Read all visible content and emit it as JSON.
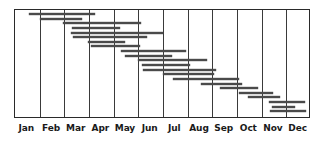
{
  "chart_data": {
    "type": "bar",
    "orientation": "horizontal",
    "subtype": "gantt",
    "title": "",
    "subtitle": "",
    "xlabel": "",
    "ylabel": "",
    "grid": true,
    "legend": null,
    "xlim": [
      0,
      12
    ],
    "x_axis_unit": "month",
    "categories": [
      "Jan",
      "Feb",
      "Mar",
      "Apr",
      "May",
      "Jun",
      "Jul",
      "Aug",
      "Sep",
      "Oct",
      "Nov",
      "Dec"
    ],
    "tick_labels": [
      "Jan",
      "Feb",
      "Mar",
      "Apr",
      "May",
      "Jun",
      "Jul",
      "Aug",
      "Sep",
      "Oct",
      "Nov",
      "Dec"
    ],
    "bar_color": "#4a4a4a",
    "frame_color": "#2a2a2a",
    "grid_color": "#3a3a3a",
    "background_color": "#ffffff",
    "task_count": 20,
    "tasks": [
      {
        "index": 1,
        "start_month": 0.55,
        "end_month": 3.25,
        "row": 1
      },
      {
        "index": 2,
        "start_month": 1.0,
        "end_month": 2.7,
        "row": 2
      },
      {
        "index": 3,
        "start_month": 1.95,
        "end_month": 5.1,
        "row": 3
      },
      {
        "index": 4,
        "start_month": 2.3,
        "end_month": 4.25,
        "row": 4
      },
      {
        "index": 5,
        "start_month": 2.25,
        "end_month": 6.0,
        "row": 5
      },
      {
        "index": 6,
        "start_month": 2.35,
        "end_month": 5.35,
        "row": 6
      },
      {
        "index": 7,
        "start_month": 2.95,
        "end_month": 4.45,
        "row": 7
      },
      {
        "index": 8,
        "start_month": 3.1,
        "end_month": 5.05,
        "row": 8
      },
      {
        "index": 9,
        "start_month": 4.3,
        "end_month": 6.95,
        "row": 9
      },
      {
        "index": 10,
        "start_month": 4.45,
        "end_month": 6.35,
        "row": 10
      },
      {
        "index": 11,
        "start_month": 5.0,
        "end_month": 7.8,
        "row": 11
      },
      {
        "index": 12,
        "start_month": 5.15,
        "end_month": 7.1,
        "row": 12
      },
      {
        "index": 13,
        "start_month": 5.2,
        "end_month": 8.15,
        "row": 13
      },
      {
        "index": 14,
        "start_month": 6.0,
        "end_month": 8.05,
        "row": 14
      },
      {
        "index": 15,
        "start_month": 6.4,
        "end_month": 9.1,
        "row": 15
      },
      {
        "index": 16,
        "start_month": 7.55,
        "end_month": 9.2,
        "row": 16
      },
      {
        "index": 17,
        "start_month": 8.3,
        "end_month": 9.85,
        "row": 17
      },
      {
        "index": 18,
        "start_month": 9.1,
        "end_month": 10.45,
        "row": 18
      },
      {
        "index": 19,
        "start_month": 9.45,
        "end_month": 10.75,
        "row": 19
      },
      {
        "index": 20,
        "start_month": 10.3,
        "end_month": 11.75,
        "row": 20
      },
      {
        "index": 21,
        "start_month": 10.4,
        "end_month": 11.35,
        "row": 21
      },
      {
        "index": 22,
        "start_month": 10.35,
        "end_month": 11.8,
        "row": 22
      }
    ]
  }
}
